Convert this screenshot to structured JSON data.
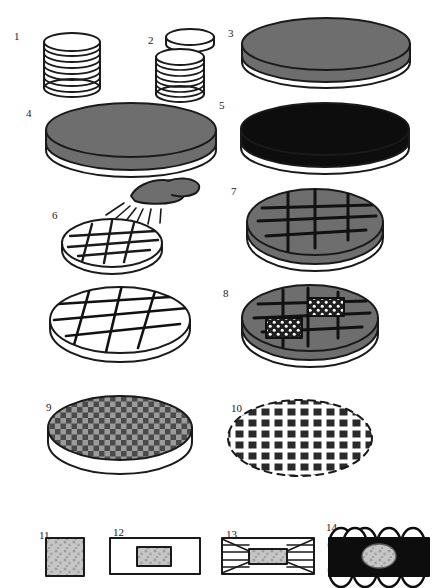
{
  "figure": {
    "background_color": "#ffffff",
    "stroke_color": "#1a1a1a",
    "gray_fill": "#6e6e6e",
    "light_gray_fill": "#c9c9c9",
    "black_fill": "#0d0d0d",
    "speckle_fill": "#bdbdbd"
  },
  "labels": [
    {
      "id": "1",
      "text": "1",
      "x": 14,
      "y": 31
    },
    {
      "id": "2",
      "text": "2",
      "x": 148,
      "y": 35
    },
    {
      "id": "3",
      "text": "3",
      "x": 228,
      "y": 28
    },
    {
      "id": "4",
      "text": "4",
      "x": 26,
      "y": 108
    },
    {
      "id": "5",
      "text": "5",
      "x": 219,
      "y": 100
    },
    {
      "id": "6",
      "text": "6",
      "x": 52,
      "y": 210
    },
    {
      "id": "7",
      "text": "7",
      "x": 231,
      "y": 186
    },
    {
      "id": "8",
      "text": "8",
      "x": 223,
      "y": 288
    },
    {
      "id": "9",
      "text": "9",
      "x": 46,
      "y": 402
    },
    {
      "id": "10",
      "text": "10",
      "x": 231,
      "y": 403
    },
    {
      "id": "11",
      "text": "11",
      "x": 39,
      "y": 530
    },
    {
      "id": "12",
      "text": "12",
      "x": 113,
      "y": 527
    },
    {
      "id": "13",
      "text": "13",
      "x": 226,
      "y": 529
    },
    {
      "id": "14",
      "text": "14",
      "x": 326,
      "y": 522
    }
  ],
  "panels": [
    {
      "id": "panel-1",
      "name": "disc-stack",
      "label": "1",
      "description": "Stack of nine thin discs"
    },
    {
      "id": "panel-2",
      "name": "disc-stack-separated",
      "label": "2",
      "description": "Stack of discs with one disc lifted off"
    },
    {
      "id": "panel-3",
      "name": "gray-disc",
      "label": "3",
      "description": "Single gray-topped disc"
    },
    {
      "id": "panel-4",
      "name": "gray-disc-large",
      "label": "4",
      "description": "Large gray-topped disc"
    },
    {
      "id": "panel-5",
      "name": "black-disc",
      "label": "5",
      "description": "Single black-topped disc"
    },
    {
      "id": "panel-6",
      "name": "disc-cut-with-scalpel",
      "label": "6",
      "description": "Scalpel blade cutting a grid into a white disc"
    },
    {
      "id": "panel-7",
      "name": "gray-disc-gridded",
      "label": "7",
      "description": "Gray disc with cut grid lines"
    },
    {
      "id": "panel-8",
      "name": "gray-disc-explants",
      "label": "8",
      "description": "Gray disc with two dark dotted explant squares"
    },
    {
      "id": "panel-9",
      "name": "disc-checkerboard",
      "label": "9",
      "description": "Disc fully divided into a checkerboard of squares"
    },
    {
      "id": "panel-10",
      "name": "separated-squares",
      "label": "10",
      "description": "Separated square pieces within dashed disc outline"
    },
    {
      "id": "panel-11",
      "name": "explant-square",
      "label": "11",
      "description": "Single speckled explant square"
    },
    {
      "id": "panel-12",
      "name": "embedded-block",
      "label": "12",
      "description": "Explant embedded in rectangular block"
    },
    {
      "id": "panel-13",
      "name": "block-trimmed",
      "label": "13",
      "description": "Trimmed block with converging section planes"
    },
    {
      "id": "panel-14",
      "name": "block-sectioned",
      "label": "14",
      "description": "Black block with scalloped section ribbon and speckled oval"
    }
  ],
  "unnumbered_panels": [
    {
      "id": "panel-large-gridded-disc",
      "name": "white-disc-gridded-large",
      "description": "Large white disc with cut grid lines"
    }
  ]
}
